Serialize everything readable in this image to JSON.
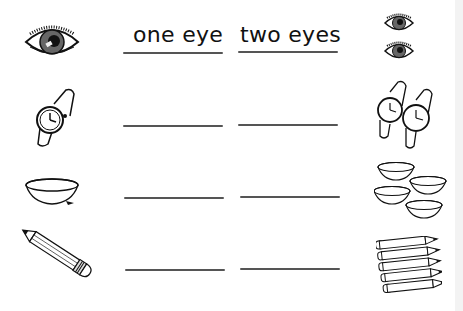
{
  "worksheet": {
    "headers": {
      "singular": "one eye",
      "plural": "two eyes"
    },
    "rows": [
      {
        "singular_image": "eye-icon",
        "plural_image": "two-eyes-icon",
        "singular_answer": "one eye",
        "plural_answer": "two eyes",
        "plural_count": 2
      },
      {
        "singular_image": "watch-icon",
        "plural_image": "two-watches-icon",
        "singular_answer": "",
        "plural_answer": "",
        "plural_count": 2
      },
      {
        "singular_image": "bowl-icon",
        "plural_image": "four-bowls-icon",
        "singular_answer": "",
        "plural_answer": "",
        "plural_count": 4
      },
      {
        "singular_image": "pencil-icon",
        "plural_image": "five-pencils-icon",
        "singular_answer": "",
        "plural_answer": "",
        "plural_count": 5
      }
    ],
    "colors": {
      "ink": "#111111",
      "line": "#555555",
      "background": "#ffffff"
    }
  }
}
